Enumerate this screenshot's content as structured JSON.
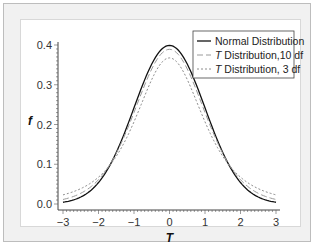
{
  "chart_data": {
    "type": "line",
    "title": "",
    "xlabel": "T",
    "ylabel": "f",
    "xlim": [
      -3,
      3
    ],
    "ylim": [
      0.0,
      0.4
    ],
    "x_ticks": [
      "−3",
      "−2",
      "−1",
      "0",
      "1",
      "2",
      "3"
    ],
    "y_ticks": [
      "0.0",
      "0.1",
      "0.2",
      "0.3",
      "0.4"
    ],
    "grid": false,
    "legend_position": "upper right",
    "x": [
      -3,
      -2.5,
      -2,
      -1.5,
      -1,
      -0.5,
      0,
      0.5,
      1,
      1.5,
      2,
      2.5,
      3
    ],
    "series": [
      {
        "name": "Normal Distribution",
        "style": "solid",
        "color": "#111111",
        "values": [
          0.004,
          0.018,
          0.054,
          0.13,
          0.242,
          0.352,
          0.399,
          0.352,
          0.242,
          0.13,
          0.054,
          0.018,
          0.004
        ]
      },
      {
        "name": "T Distribution,10 df",
        "style": "dashed",
        "color": "#999999",
        "values": [
          0.011,
          0.027,
          0.061,
          0.127,
          0.23,
          0.34,
          0.389,
          0.34,
          0.23,
          0.127,
          0.061,
          0.027,
          0.011
        ]
      },
      {
        "name": "T Distribution, 3 df",
        "style": "dotted",
        "color": "#888888",
        "values": [
          0.023,
          0.036,
          0.068,
          0.124,
          0.207,
          0.313,
          0.368,
          0.313,
          0.207,
          0.124,
          0.068,
          0.036,
          0.023
        ]
      }
    ]
  },
  "legend": {
    "items": [
      {
        "prefix": "",
        "label": "Normal Distribution"
      },
      {
        "prefix": "T",
        "label": " Distribution,10 df"
      },
      {
        "prefix": "T",
        "label": " Distribution, 3 df"
      }
    ]
  }
}
